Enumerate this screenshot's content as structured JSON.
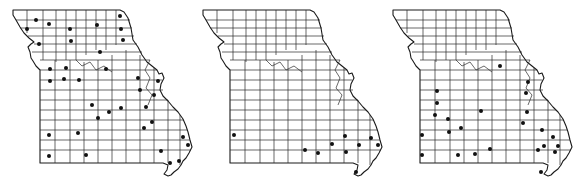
{
  "figure": {
    "panels": [
      {
        "id": "map-1",
        "offset_x": 0,
        "dots": [
          [
            36,
            20
          ],
          [
            49,
            24
          ],
          [
            27,
            29
          ],
          [
            70,
            29
          ],
          [
            97,
            25
          ],
          [
            120,
            16
          ],
          [
            121,
            29
          ],
          [
            123,
            40
          ],
          [
            71,
            41
          ],
          [
            39,
            44
          ],
          [
            100,
            52
          ],
          [
            50,
            69
          ],
          [
            66,
            68
          ],
          [
            106,
            69
          ],
          [
            138,
            78
          ],
          [
            50,
            81
          ],
          [
            64,
            79
          ],
          [
            79,
            80
          ],
          [
            158,
            81
          ],
          [
            140,
            90
          ],
          [
            154,
            95
          ],
          [
            92,
            105
          ],
          [
            109,
            112
          ],
          [
            121,
            108
          ],
          [
            146,
            107
          ],
          [
            98,
            118
          ],
          [
            152,
            122
          ],
          [
            144,
            128
          ],
          [
            183,
            137
          ],
          [
            49,
            135
          ],
          [
            78,
            133
          ],
          [
            161,
            151
          ],
          [
            49,
            156
          ],
          [
            86,
            155
          ],
          [
            170,
            163
          ],
          [
            179,
            161
          ],
          [
            188,
            145
          ]
        ]
      },
      {
        "id": "map-2",
        "offset_x": 190,
        "dots": [
          [
            234,
            135
          ],
          [
            305,
            150
          ],
          [
            318,
            153
          ],
          [
            332,
            144
          ],
          [
            345,
            136
          ],
          [
            346,
            152
          ],
          [
            359,
            145
          ],
          [
            371,
            138
          ],
          [
            378,
            145
          ],
          [
            356,
            172
          ]
        ]
      },
      {
        "id": "map-3",
        "offset_x": 380,
        "dots": [
          [
            500,
            66
          ],
          [
            528,
            82
          ],
          [
            526,
            93
          ],
          [
            437,
            91
          ],
          [
            437,
            103
          ],
          [
            435,
            115
          ],
          [
            448,
            119
          ],
          [
            481,
            111
          ],
          [
            527,
            112
          ],
          [
            523,
            123
          ],
          [
            449,
            132
          ],
          [
            422,
            135
          ],
          [
            461,
            128
          ],
          [
            542,
            130
          ],
          [
            553,
            137
          ],
          [
            544,
            146
          ],
          [
            558,
            146
          ],
          [
            422,
            155
          ],
          [
            458,
            155
          ],
          [
            475,
            154
          ],
          [
            490,
            149
          ],
          [
            538,
            150
          ],
          [
            555,
            152
          ],
          [
            541,
            172
          ]
        ]
      }
    ],
    "colors": {
      "line": "#1a1a1a",
      "dot": "#111111",
      "background": "#ffffff"
    }
  }
}
